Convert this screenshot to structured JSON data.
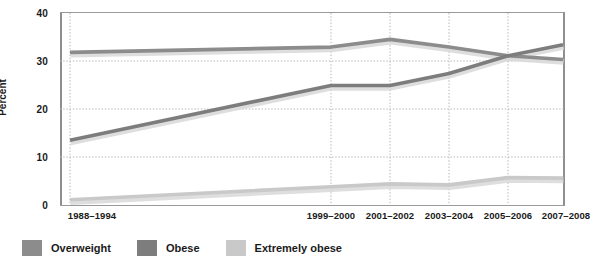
{
  "chart_data": {
    "type": "line",
    "title": "",
    "xlabel": "",
    "ylabel": "Percent",
    "ylim": [
      0,
      40
    ],
    "yticks": [
      0,
      10,
      20,
      30,
      40
    ],
    "grid": true,
    "legend_position": "bottom-left",
    "categories": [
      "1988–1994",
      "1999–2000",
      "2001–2002",
      "2003–2004",
      "2005–2006",
      "2007–2008"
    ],
    "series": [
      {
        "name": "Overweight",
        "color": "#8c8c8c",
        "values": [
          31.8,
          32.9,
          34.5,
          32.9,
          31.1,
          30.3
        ]
      },
      {
        "name": "Obese",
        "color": "#7d7d7d",
        "values": [
          13.5,
          24.9,
          24.9,
          27.4,
          31.1,
          33.4
        ]
      },
      {
        "name": "Extremely obese",
        "color": "#c9c9c9",
        "values": [
          1.1,
          3.8,
          4.4,
          4.2,
          5.7,
          5.6
        ]
      }
    ]
  },
  "axes": {
    "y_title": "Percent",
    "y_tick_labels": [
      "40",
      "30",
      "20",
      "10",
      "0"
    ],
    "x_tick_labels": [
      "1988–1994",
      "1999–2000",
      "2001–2002",
      "2003–2004",
      "2005–2006",
      "2007–2008"
    ]
  },
  "legend": {
    "items": [
      {
        "label": "Overweight",
        "color": "#8c8c8c"
      },
      {
        "label": "Obese",
        "color": "#7d7d7d"
      },
      {
        "label": "Extremely obese",
        "color": "#c9c9c9"
      }
    ]
  },
  "colors": {
    "background": "#ffffff",
    "axis": "#8f8f8f",
    "gridline": "#b5b5b5",
    "text": "#1a1a1a",
    "overweight": "#8c8c8c",
    "obese": "#7d7d7d",
    "extremely_obese": "#c9c9c9",
    "line_shadow": "#d8d8d8"
  }
}
